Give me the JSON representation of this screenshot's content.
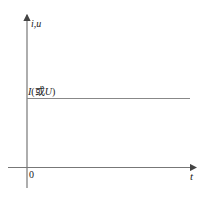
{
  "diagram": {
    "title": "",
    "y_axis_label": "i,u",
    "x_axis_label": "t",
    "origin_label": "0",
    "constant_line_label": "I(或U)",
    "constant_line_label_parts": {
      "var1": "I",
      "open": "(",
      "or": "或",
      "var2": "U",
      "close": ")"
    },
    "colors": {
      "axis": "#777777",
      "line": "#888888",
      "text": "#222222"
    }
  }
}
